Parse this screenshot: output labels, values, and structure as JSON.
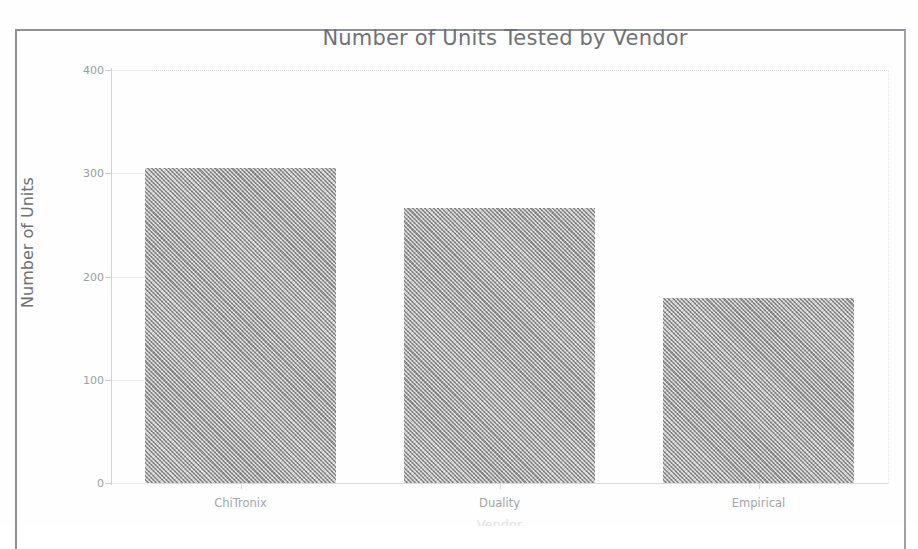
{
  "chart_data": {
    "type": "bar",
    "title": "Number of Units Tested by Vendor",
    "categories": [
      "ChiTronix",
      "Duality",
      "Empirical"
    ],
    "values": [
      305,
      266,
      179
    ],
    "xlabel": "Vendor",
    "ylabel": "Number of Units",
    "ylim": [
      0,
      400
    ],
    "yticks": [
      0,
      100,
      200,
      300,
      400
    ],
    "ytick_labels": [
      "0",
      "100",
      "200",
      "300",
      "400"
    ],
    "grid": false,
    "legend": null,
    "legend_position": "none",
    "bar_color": "#9b9b9b",
    "bar_pattern": "dithered-gray-halftone",
    "axis_color": "#d2d3d6",
    "title_color": "#6e7176",
    "tick_label_color": "#9a9da2"
  },
  "document": {
    "border_color": "#8d9096",
    "background": "#fefefe"
  }
}
